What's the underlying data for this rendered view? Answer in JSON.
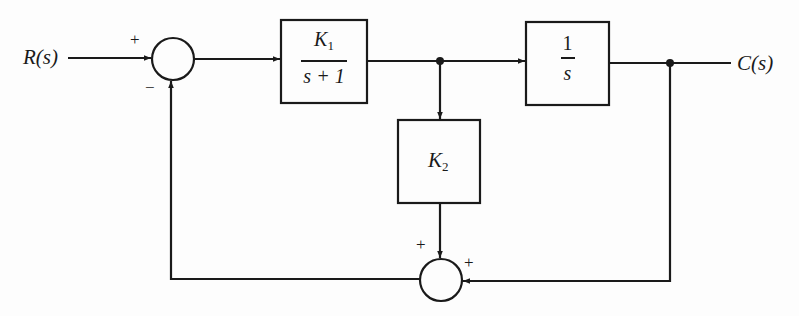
{
  "diagram": {
    "type": "block-diagram",
    "input_label": "R(s)",
    "output_label": "C(s)",
    "blocks": [
      {
        "id": "g1",
        "numerator": "K",
        "numerator_sub": "1",
        "denominator": "s + 1"
      },
      {
        "id": "g2",
        "numerator": "1",
        "denominator": "s"
      },
      {
        "id": "h",
        "label": "K",
        "label_sub": "2"
      }
    ],
    "summing_junctions": [
      {
        "id": "sum1",
        "signs": {
          "left": "+",
          "bottom": "−"
        }
      },
      {
        "id": "sum2",
        "signs": {
          "top": "+",
          "right": "+"
        }
      }
    ],
    "colors": {
      "line": "#1a1a1a",
      "background": "#fdfdfd"
    }
  }
}
